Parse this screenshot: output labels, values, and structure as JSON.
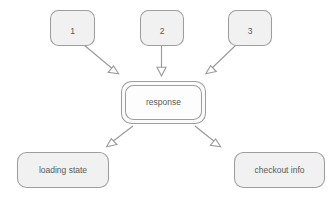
{
  "diagram": {
    "type": "flow-diagram",
    "background_color": "#ffffff",
    "node_fill_color": "#f1f1f1",
    "node_border_color": "#9e9e9e",
    "edge_color": "#9a9a9a",
    "label_color": "#5a5a5a",
    "inputs": [
      {
        "id": "input-1",
        "label": "1"
      },
      {
        "id": "input-2",
        "label": "2"
      },
      {
        "id": "input-3",
        "label": "3"
      }
    ],
    "center": {
      "id": "response",
      "label": "response",
      "style": "double-border"
    },
    "outputs": [
      {
        "id": "loading-state",
        "label": "loading state"
      },
      {
        "id": "checkout-info",
        "label": "checkout info"
      }
    ],
    "edges": [
      {
        "from": "1",
        "to": "response",
        "arrowhead": "open-triangle"
      },
      {
        "from": "2",
        "to": "response",
        "arrowhead": "open-triangle"
      },
      {
        "from": "3",
        "to": "response",
        "arrowhead": "open-triangle"
      },
      {
        "from": "response",
        "to": "loading state",
        "arrowhead": "open-triangle"
      },
      {
        "from": "response",
        "to": "checkout info",
        "arrowhead": "open-triangle"
      }
    ]
  }
}
